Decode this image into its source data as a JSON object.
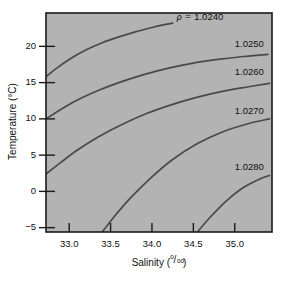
{
  "chart_data": {
    "type": "line",
    "title": "",
    "xlabel": "Salinity",
    "xlabel_units": "per mille",
    "ylabel": "Temperature (°C)",
    "xlim": [
      32.72,
      35.45
    ],
    "ylim": [
      -5.6,
      24.6
    ],
    "grid": false,
    "legend": "inline-contour-labels",
    "plot_background": "#b3b3b3",
    "line_color": "#4a4a4a",
    "axis_color": "#1a1a1a",
    "variable_symbol": "ρ",
    "variable_prefix": "ρ = ",
    "xticks": [
      "33.0",
      "33.5",
      "34.0",
      "34.5",
      "35.0"
    ],
    "xtick_values": [
      33.0,
      33.5,
      34.0,
      34.5,
      35.0
    ],
    "yticks": [
      "20",
      "15",
      "10",
      "5",
      "0",
      "−5"
    ],
    "ytick_values": [
      20,
      15,
      10,
      5,
      0,
      -5
    ],
    "series": [
      {
        "name": "1.0240",
        "label": "1.0240",
        "label_has_prefix": true,
        "x": [
          32.72,
          32.85,
          33.0,
          33.2,
          33.4,
          33.6,
          33.8,
          34.0,
          34.15,
          34.25
        ],
        "y": [
          15.8,
          17.0,
          18.2,
          19.5,
          20.5,
          21.3,
          22.0,
          22.6,
          23.0,
          23.2
        ]
      },
      {
        "name": "1.0250",
        "label": "1.0250",
        "label_has_prefix": false,
        "x": [
          32.72,
          32.9,
          33.1,
          33.35,
          33.6,
          33.9,
          34.2,
          34.5,
          34.8,
          35.1,
          35.4
        ],
        "y": [
          10.0,
          11.3,
          12.6,
          13.9,
          15.0,
          16.1,
          17.0,
          17.7,
          18.2,
          18.6,
          18.9
        ]
      },
      {
        "name": "1.0260",
        "label": "1.0260",
        "label_has_prefix": false,
        "x": [
          32.72,
          32.9,
          33.1,
          33.35,
          33.65,
          33.95,
          34.25,
          34.55,
          34.85,
          35.15,
          35.42
        ],
        "y": [
          2.4,
          4.0,
          5.7,
          7.5,
          9.3,
          10.8,
          12.0,
          13.0,
          13.8,
          14.4,
          14.9
        ]
      },
      {
        "name": "1.0270",
        "label": "1.0270",
        "label_has_prefix": false,
        "x": [
          33.4,
          33.55,
          33.75,
          34.0,
          34.25,
          34.55,
          34.85,
          35.15,
          35.42
        ],
        "y": [
          -5.6,
          -3.4,
          -0.8,
          2.0,
          4.4,
          6.6,
          8.2,
          9.3,
          10.0
        ]
      },
      {
        "name": "1.0280",
        "label": "1.0280",
        "label_has_prefix": false,
        "x": [
          34.55,
          34.7,
          34.9,
          35.1,
          35.3,
          35.42
        ],
        "y": [
          -5.6,
          -3.6,
          -1.3,
          0.5,
          1.7,
          2.2
        ]
      }
    ],
    "contour_labels": [
      {
        "text": "1.0240",
        "prefix": "ρ = ",
        "x": 34.3,
        "y": 24.0
      },
      {
        "text": "1.0250",
        "prefix": "",
        "x": 35.0,
        "y": 20.3
      },
      {
        "text": "1.0260",
        "prefix": "",
        "x": 35.0,
        "y": 16.4
      },
      {
        "text": "1.0270",
        "prefix": "",
        "x": 35.0,
        "y": 11.0
      },
      {
        "text": "1.0280",
        "prefix": "",
        "x": 35.0,
        "y": 3.3
      }
    ]
  },
  "axes": {
    "ylabel": "Temperature (°C)",
    "xlabel_text": "Salinity (",
    "xlabel_close": ")",
    "permille_num": "o",
    "permille_slash": "/",
    "permille_den": "oo"
  }
}
